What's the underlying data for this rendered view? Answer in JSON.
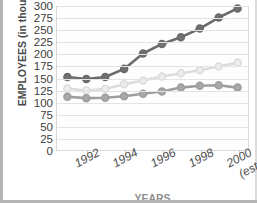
{
  "chart_data": {
    "type": "line",
    "title": "",
    "xlabel": "YEARS",
    "ylabel": "EMPLOYEES (in thousands)",
    "ylim": [
      0,
      300
    ],
    "ytick_values": [
      0,
      25,
      50,
      75,
      100,
      125,
      150,
      175,
      200,
      225,
      250,
      275,
      300
    ],
    "ytick_labels": [
      "0",
      "25",
      "50",
      "75",
      "100",
      "125",
      "150",
      "175",
      "200",
      "225",
      "250",
      "275",
      "300"
    ],
    "grid": true,
    "legend": "none",
    "x": [
      1991,
      1992,
      1993,
      1994,
      1995,
      1996,
      1997,
      1998,
      1999,
      2000
    ],
    "xtick_values": [
      1992,
      1994,
      1996,
      1998,
      2000
    ],
    "xtick_labels": [
      "1992",
      "1994",
      "1996",
      "1998",
      "2000"
    ],
    "xtick_sublabels": [
      "",
      "",
      "",
      "",
      "(est.)"
    ],
    "series": [
      {
        "name": "dark-series",
        "color": "#6b6b6b",
        "marker_fill": "#707070",
        "values": [
          152,
          148,
          152,
          169,
          201,
          221,
          235,
          253,
          276,
          295
        ]
      },
      {
        "name": "light-series",
        "color": "#dcdcdc",
        "marker_fill": "#ededed",
        "values": [
          128,
          124,
          127,
          137,
          145,
          153,
          160,
          166,
          174,
          182
        ]
      },
      {
        "name": "medium-series",
        "color": "#9e9e9e",
        "marker_fill": "#a8a8a8",
        "values": [
          111,
          108,
          109,
          112,
          117,
          122,
          130,
          134,
          135,
          130
        ]
      }
    ]
  }
}
